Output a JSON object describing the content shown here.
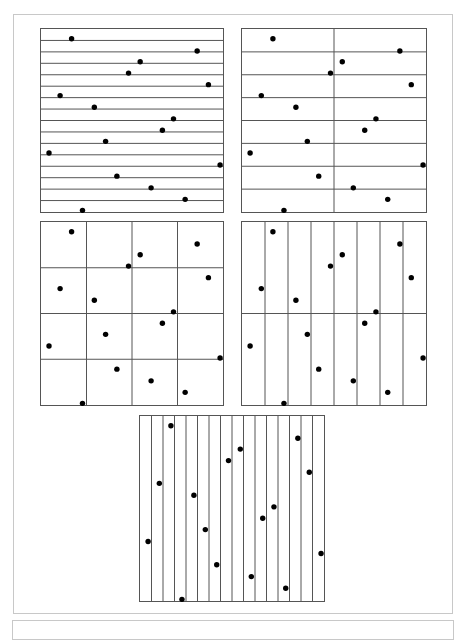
{
  "figure": {
    "point_color": "#000000",
    "grid_color": "#555555",
    "points": [
      [
        0.168,
        0.053
      ],
      [
        0.858,
        0.12
      ],
      [
        0.545,
        0.179
      ],
      [
        0.481,
        0.241
      ],
      [
        0.92,
        0.304
      ],
      [
        0.105,
        0.364
      ],
      [
        0.293,
        0.428
      ],
      [
        0.728,
        0.491
      ],
      [
        0.667,
        0.553
      ],
      [
        0.355,
        0.614
      ],
      [
        0.044,
        0.678
      ],
      [
        0.984,
        0.743
      ],
      [
        0.417,
        0.804
      ],
      [
        0.605,
        0.868
      ],
      [
        0.792,
        0.931
      ],
      [
        0.228,
        0.991
      ]
    ],
    "panels": [
      {
        "id": "panel-16x1",
        "cols": 1,
        "rows": 16,
        "left": 40,
        "top": 28,
        "width": 184,
        "height": 185
      },
      {
        "id": "panel-8x2",
        "cols": 2,
        "rows": 8,
        "left": 241,
        "top": 28,
        "width": 186,
        "height": 185
      },
      {
        "id": "panel-4x4",
        "cols": 4,
        "rows": 4,
        "left": 40,
        "top": 221,
        "width": 184,
        "height": 185
      },
      {
        "id": "panel-2x8",
        "cols": 8,
        "rows": 2,
        "left": 241,
        "top": 221,
        "width": 186,
        "height": 185
      },
      {
        "id": "panel-1x16",
        "cols": 16,
        "rows": 1,
        "left": 139,
        "top": 415,
        "width": 186,
        "height": 187
      }
    ]
  }
}
